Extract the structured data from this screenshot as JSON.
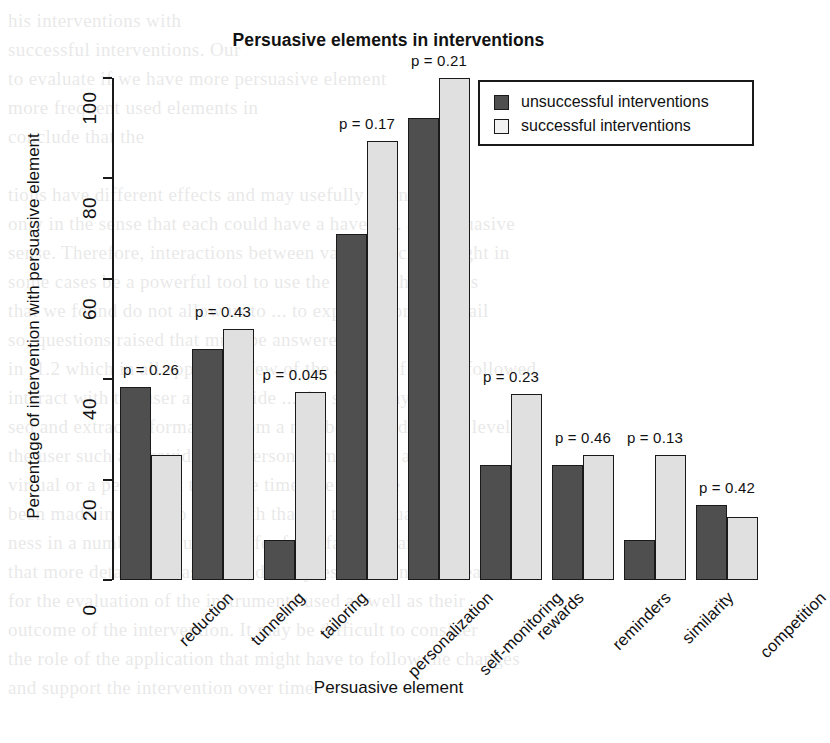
{
  "chart_data": {
    "type": "bar",
    "title": "Persuasive elements in interventions",
    "xlabel": "Persuasive element",
    "ylabel": "Percentage of intervention with persuasive element",
    "ylim": [
      0,
      100
    ],
    "yticks": [
      0,
      20,
      40,
      60,
      80,
      100
    ],
    "ytick_labels": [
      "0",
      "20",
      "40",
      "60",
      "80",
      "100"
    ],
    "grid": false,
    "legend_position": "top-right",
    "categories": [
      "reduction",
      "tunneling",
      "tailoring",
      "personalization",
      "self-monitoring",
      "rewards",
      "reminders",
      "similarity",
      "competition"
    ],
    "series": [
      {
        "name": "unsuccessful interventions",
        "color": "#4f4f4f",
        "values": [
          38.5,
          46,
          8,
          69,
          92,
          23,
          23,
          8,
          15
        ]
      },
      {
        "name": "successful interventions",
        "color": "#e0e0e0",
        "values": [
          25,
          50,
          37.5,
          87.5,
          100,
          37,
          25,
          25,
          12.5
        ]
      }
    ],
    "annotations": [
      "p = 0.26",
      "p = 0.43",
      "p = 0.045",
      "p = 0.17",
      "p = 0.21",
      "p = 0.23",
      "p = 0.46",
      "p = 0.13",
      "p = 0.42"
    ]
  },
  "legend": {
    "entries": [
      {
        "label": "unsuccessful interventions",
        "swatch": "dark"
      },
      {
        "label": "successful interventions",
        "swatch": "light"
      }
    ]
  },
  "background_text": "his interventions with\nsuccessful interventions. Our\nto evaluate if we have more persuasive element\nmore frequent used elements in\nconclude that the\n\ntions have different effects and may usefully ... and\nonly in the sense that each could have a have a ... an persuasive\nsense. Therefore, interactions between various tech ... might in\nsome cases be a powerful tool to use the first ... the studies\nthat we found do not allow us to ... to explore more in detail\nso, questions raised that must be answered\nin ´1.2 which in all apply and few of the aspect of ... one followed\ninteract with the user and provide ... the same way\nsed and extract information from a number of ... different levels\nthe user such as providing in person ... modeling a\nvirtual or a person. At the same time, the ... more\nbeen made in a way to deal with that on the persuasive\nness in a number of studies suffer from fairly clear\nthat more detailed measures and analyses are ... in this area.\nfor the evaluation of the instruments used as well as their\noutcome of the intervention. It may be difficult to consider\nthe role of the application that might have to follow the changes\nand support the intervention over time."
}
